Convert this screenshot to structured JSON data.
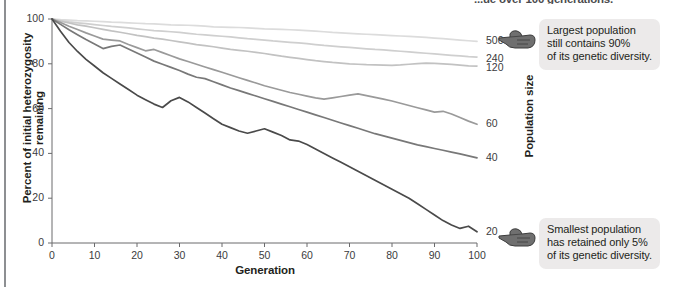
{
  "header": {
    "note": "...ue over 100 generations."
  },
  "axes": {
    "y_title": "Percent of initial heterozygosity remaining",
    "x_title": "Generation",
    "series_axis_title": "Population size",
    "y_ticks": [
      "0",
      "20",
      "40",
      "60",
      "80",
      "100"
    ],
    "x_ticks": [
      "0",
      "10",
      "20",
      "30",
      "40",
      "50",
      "60",
      "70",
      "80",
      "90",
      "100"
    ]
  },
  "annotations": [
    {
      "name": "largest-population-callout",
      "icon": "pointing-hand-icon",
      "lines": [
        "Largest population",
        "still contains 90%",
        "of its genetic diversity."
      ]
    },
    {
      "name": "smallest-population-callout",
      "icon": "pointing-hand-icon",
      "lines": [
        "Smallest population",
        "has retained only 5%",
        "of its genetic diversity."
      ]
    }
  ],
  "chart_data": {
    "type": "line",
    "title": "",
    "xlabel": "Generation",
    "ylabel": "Percent of initial heterozygosity remaining",
    "xlim": [
      0,
      100
    ],
    "ylim": [
      0,
      100
    ],
    "grid": false,
    "legend_position": "right-end-labels",
    "x": [
      0,
      2,
      4,
      6,
      8,
      10,
      12,
      14,
      16,
      18,
      20,
      22,
      24,
      26,
      28,
      30,
      32,
      34,
      36,
      38,
      40,
      42,
      44,
      46,
      48,
      50,
      52,
      54,
      56,
      58,
      60,
      62,
      64,
      66,
      68,
      70,
      72,
      74,
      76,
      78,
      80,
      82,
      84,
      86,
      88,
      90,
      92,
      94,
      96,
      98,
      100
    ],
    "series": [
      {
        "name": "500",
        "label": "500",
        "color": "#dcdcdc",
        "end_value": 90,
        "values": [
          100,
          99.7,
          99.5,
          99.3,
          99.2,
          99.0,
          98.8,
          98.6,
          98.5,
          98.3,
          98.1,
          97.9,
          97.8,
          97.6,
          97.4,
          97.3,
          97.2,
          97.0,
          96.8,
          96.5,
          96.4,
          96.3,
          96.2,
          96.0,
          95.8,
          95.6,
          95.5,
          95.4,
          95.2,
          95.0,
          94.8,
          94.6,
          94.3,
          94.0,
          93.8,
          93.6,
          93.4,
          93.2,
          93.0,
          92.8,
          92.6,
          92.4,
          92.2,
          92.0,
          91.8,
          91.5,
          91.2,
          90.9,
          90.6,
          90.3,
          90.0
        ]
      },
      {
        "name": "240",
        "label": "240",
        "color": "#cfcfcf",
        "end_value": 83,
        "values": [
          100,
          99.3,
          98.7,
          98.3,
          97.9,
          97.5,
          97.1,
          96.7,
          96.4,
          96.0,
          95.6,
          95.2,
          94.8,
          94.6,
          94.3,
          94.0,
          93.6,
          93.2,
          92.9,
          92.6,
          92.3,
          92.0,
          91.6,
          91.2,
          90.9,
          90.6,
          90.2,
          89.9,
          89.6,
          89.3,
          89.0,
          88.6,
          88.2,
          87.9,
          87.6,
          87.3,
          87.0,
          86.7,
          86.4,
          86.2,
          85.9,
          85.6,
          85.3,
          85.0,
          84.7,
          84.4,
          84.1,
          83.8,
          83.5,
          83.2,
          83.0
        ]
      },
      {
        "name": "120",
        "label": "120",
        "color": "#c2c2c2",
        "end_value": 79,
        "values": [
          100,
          99.0,
          98.2,
          97.4,
          96.8,
          96.1,
          95.4,
          94.7,
          94.1,
          93.4,
          92.7,
          92.1,
          91.5,
          91.0,
          90.4,
          89.8,
          89.2,
          88.6,
          88.1,
          87.6,
          87.0,
          86.4,
          86.0,
          85.6,
          85.1,
          84.6,
          84.0,
          83.4,
          82.9,
          82.4,
          81.9,
          81.4,
          81.0,
          80.6,
          80.3,
          80.0,
          79.8,
          79.6,
          79.5,
          79.4,
          79.3,
          79.5,
          79.8,
          80.1,
          80.3,
          80.2,
          80.0,
          79.7,
          79.4,
          79.1,
          79.0
        ]
      },
      {
        "name": "60",
        "label": "60",
        "color": "#9a9a9a",
        "end_value": 53,
        "values": [
          100,
          98.4,
          96.8,
          95.3,
          93.8,
          92.4,
          91.0,
          90.6,
          90.2,
          88.6,
          87.2,
          85.8,
          86.4,
          85.0,
          83.6,
          82.2,
          81.0,
          79.8,
          78.6,
          77.4,
          76.2,
          75.0,
          73.8,
          72.6,
          71.4,
          70.2,
          69.2,
          68.2,
          67.2,
          66.4,
          65.6,
          64.8,
          64.2,
          64.8,
          65.4,
          66.0,
          66.6,
          65.8,
          65.0,
          64.2,
          63.4,
          62.4,
          61.4,
          60.4,
          59.4,
          58.4,
          58.8,
          57.6,
          56.0,
          54.4,
          53.0
        ]
      },
      {
        "name": "40",
        "label": "40",
        "color": "#787878",
        "end_value": 38,
        "values": [
          100,
          97.6,
          95.2,
          93.0,
          90.8,
          88.8,
          86.8,
          87.8,
          88.4,
          86.6,
          84.8,
          83.0,
          81.2,
          79.8,
          78.4,
          77.0,
          75.4,
          74.0,
          73.4,
          72.0,
          70.6,
          69.2,
          68.0,
          66.8,
          65.6,
          64.4,
          63.2,
          62.0,
          60.8,
          59.6,
          58.4,
          57.2,
          56.0,
          54.8,
          53.6,
          52.4,
          51.2,
          50.0,
          48.8,
          47.8,
          46.8,
          45.8,
          44.8,
          43.8,
          43.0,
          42.2,
          41.4,
          40.6,
          39.8,
          38.9,
          38.0
        ]
      },
      {
        "name": "20",
        "label": "20",
        "color": "#4a4a4a",
        "end_value": 5,
        "values": [
          100,
          94.5,
          89.5,
          85.5,
          82.0,
          79.0,
          76.0,
          73.5,
          71.0,
          68.5,
          66.0,
          64.0,
          62.0,
          60.5,
          63.5,
          65.0,
          63.0,
          60.5,
          58.0,
          55.5,
          53.0,
          51.5,
          50.0,
          49.0,
          50.0,
          51.0,
          49.5,
          48.0,
          46.0,
          45.5,
          44.0,
          42.0,
          40.0,
          38.0,
          36.0,
          34.0,
          32.0,
          30.0,
          28.0,
          26.0,
          24.0,
          22.0,
          20.0,
          17.5,
          15.0,
          12.5,
          10.0,
          8.0,
          6.5,
          7.5,
          5.0
        ]
      }
    ]
  }
}
